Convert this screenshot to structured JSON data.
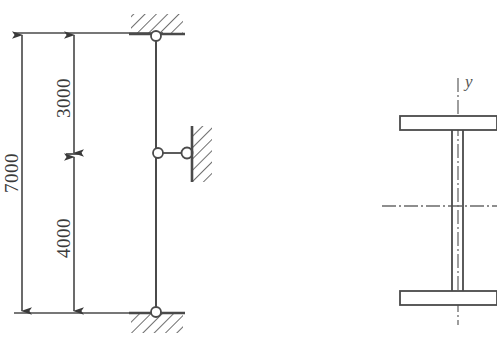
{
  "figure": {
    "background_color": "#ffffff",
    "line_color": "#4a4a4a",
    "text_color": "#3a3a3a"
  },
  "frame_diagram": {
    "title": "",
    "column": {
      "top_y_label": "",
      "bottom_y_label": ""
    },
    "dimensions": [
      {
        "name": "total-height",
        "value": "7000",
        "orientation": "vertical",
        "rotated": true
      },
      {
        "name": "upper-segment",
        "value": "3000",
        "orientation": "vertical",
        "rotated": true
      },
      {
        "name": "lower-segment",
        "value": "4000",
        "orientation": "vertical",
        "rotated": true
      }
    ],
    "supports": [
      {
        "name": "top-pin-support",
        "type": "pin",
        "hatch": "above"
      },
      {
        "name": "mid-link-support",
        "type": "horizontal-link",
        "hatch": "right-wall"
      },
      {
        "name": "bottom-pin-support",
        "type": "pin",
        "hatch": "below"
      }
    ]
  },
  "cross_section": {
    "label_y": "y",
    "shape": "I-beam",
    "centerlines": [
      {
        "name": "vertical-centerline",
        "style": "dash-dot"
      },
      {
        "name": "horizontal-centerline",
        "style": "dash-dot"
      }
    ],
    "parts": [
      {
        "name": "top-flange"
      },
      {
        "name": "web"
      },
      {
        "name": "bottom-flange"
      }
    ]
  }
}
